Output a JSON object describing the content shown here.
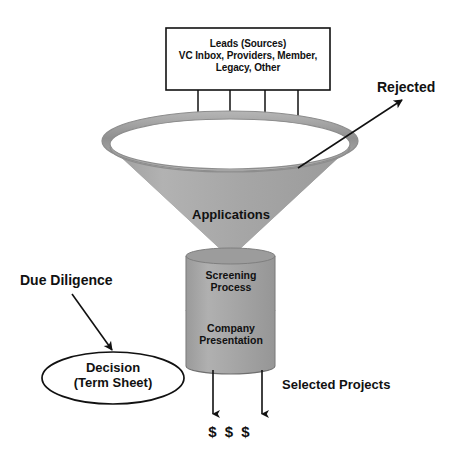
{
  "diagram": {
    "background_color": "#ffffff",
    "stroke_color": "#111111",
    "funnel_fill": "#a8a8a8",
    "funnel_rim_fill": "#9a9a9a",
    "stem_fill": "#a3a3a3"
  },
  "leads_box": {
    "line1": "Leads (Sources)",
    "line2": "VC Inbox, Providers, Member,",
    "line3": "Legacy, Other"
  },
  "funnel": {
    "applications_label": "Applications",
    "screening_line1": "Screening",
    "screening_line2": "Process",
    "company_line1": "Company",
    "company_line2": "Presentation"
  },
  "annotations": {
    "rejected": "Rejected",
    "due_diligence": "Due Diligence",
    "selected_projects": "Selected Projects",
    "money": "$ $ $"
  },
  "decision": {
    "line1": "Decision",
    "line2": "(Term Sheet)"
  }
}
